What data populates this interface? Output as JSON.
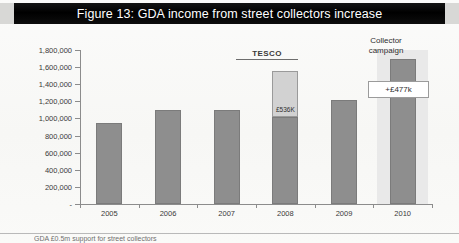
{
  "figure": {
    "title": "Figure 13: GDA income from street collectors increase",
    "title_bar_color": "#000000",
    "title_text_color": "#ffffff"
  },
  "footer": {
    "text": "GDA £0.5m support for street collectors"
  },
  "annotations": {
    "tesco": "TESCO",
    "tesco_segment_value": "£536K",
    "campaign_line1": "Collector",
    "campaign_line2": "campaign",
    "delta_callout": "+£477k"
  },
  "colors": {
    "bar": "#8e8e8e",
    "bar_border": "#7b7b7b",
    "stack_top": "#d2d2d2",
    "stack_top_border": "#9a9a9a",
    "highlight_band": "#e9e9e9",
    "axis": "#8c8c8c"
  },
  "chart_data": {
    "type": "bar",
    "title": "Figure 13: GDA income from street collectors increase",
    "subtitle": "",
    "xlabel": "",
    "ylabel": "",
    "categories": [
      "2005",
      "2006",
      "2007",
      "2008",
      "2009",
      "2010"
    ],
    "series": [
      {
        "name": "Street collector income",
        "values": [
          950000,
          1100000,
          1100000,
          1020000,
          1210000,
          1690000
        ]
      },
      {
        "name": "TESCO contribution",
        "values": [
          0,
          0,
          0,
          536000,
          0,
          0
        ]
      }
    ],
    "stacked": true,
    "totals": [
      950000,
      1100000,
      1100000,
      1556000,
      1210000,
      1690000
    ],
    "ylim": [
      0,
      1800000
    ],
    "ytick_values": [
      0,
      200000,
      400000,
      600000,
      800000,
      1000000,
      1200000,
      1400000,
      1600000,
      1800000
    ],
    "ytick_labels": [
      "-",
      "200,000",
      "400,000",
      "600,000",
      "800,000",
      "1,000,000",
      "1,200,000",
      "1,400,000",
      "1,600,000",
      "1,800,000"
    ],
    "grid": false,
    "legend": "none",
    "highlighted_category": "2010",
    "annotations": [
      {
        "text": "TESCO",
        "category": "2008",
        "kind": "label-above"
      },
      {
        "text": "£536K",
        "category": "2008",
        "kind": "segment-value"
      },
      {
        "text": "Collector campaign",
        "category": "2010",
        "kind": "label-above"
      },
      {
        "text": "+£477k",
        "category": "2010",
        "kind": "callout-box"
      }
    ]
  }
}
